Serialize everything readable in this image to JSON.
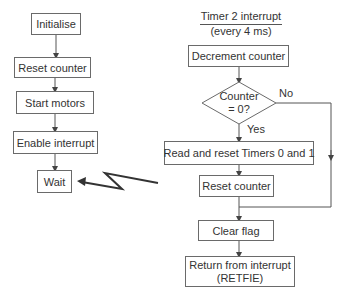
{
  "main_flow": {
    "initialise": "Initialise",
    "reset_counter": "Reset counter",
    "start_motors": "Start motors",
    "enable_interrupt": "Enable interrupt",
    "wait": "Wait"
  },
  "interrupt_flow": {
    "title_line1": "Timer 2 interrupt",
    "title_line2": "(every 4 ms)",
    "decrement_counter": "Decrement counter",
    "decision_line1": "Counter",
    "decision_line2": "= 0?",
    "no_label": "No",
    "yes_label": "Yes",
    "read_reset_timers": "Read and reset Timers 0 and 1",
    "reset_counter": "Reset counter",
    "clear_flag": "Clear flag",
    "return_line1": "Return from interrupt",
    "return_line2": "(RETFIE)"
  },
  "colors": {
    "line": "#555555",
    "border": "#6a6a6a",
    "text": "#333333"
  }
}
